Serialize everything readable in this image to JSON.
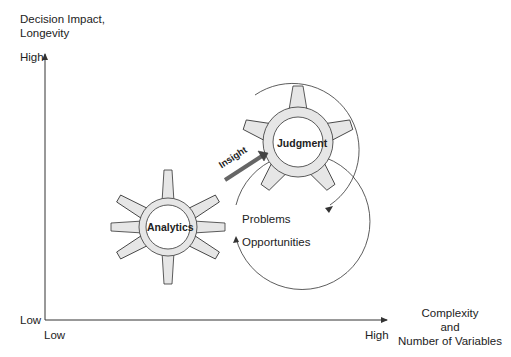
{
  "y_axis": {
    "title_line1": "Decision Impact,",
    "title_line2": "Longevity",
    "high": "High",
    "low": "Low"
  },
  "x_axis": {
    "low": "Low",
    "high": "High",
    "title_line1": "Complexity",
    "title_line2": "and",
    "title_line3": "Number of Variables"
  },
  "gears": {
    "analytics": {
      "label": "Analytics",
      "fill": "#e6e6e6"
    },
    "judgment": {
      "label": "Judgment",
      "fill": "#e6e6e6"
    }
  },
  "arrow_label": "Insight",
  "side_labels": {
    "problems": "Problems",
    "opportunities": "Opportunities"
  },
  "colors": {
    "line": "#333333",
    "arrow": "#666666"
  }
}
